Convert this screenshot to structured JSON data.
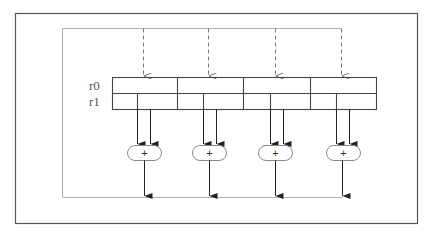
{
  "diagram": {
    "title": "",
    "registers": [
      {
        "name": "r0",
        "label": "r0",
        "cells": 4
      },
      {
        "name": "r1",
        "label": "r1",
        "cells": 8
      }
    ],
    "adders": [
      {
        "id": "adder-1",
        "op": "+"
      },
      {
        "id": "adder-2",
        "op": "+"
      },
      {
        "id": "adder-3",
        "op": "+"
      },
      {
        "id": "adder-4",
        "op": "+"
      }
    ],
    "inputs": {
      "count": 4,
      "style": "dashed"
    },
    "outputs": {
      "count": 4
    },
    "colors": {
      "outer_frame": "#555555",
      "inner_frame": "#b0b0b0",
      "register_lines": "#444444",
      "arrows": "#222222",
      "dashed_arrows": "#777777",
      "adder_stroke": "#888888"
    }
  }
}
